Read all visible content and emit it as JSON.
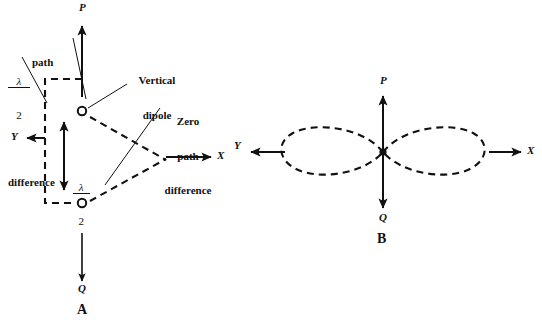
{
  "figure": {
    "ink_color": "#111111",
    "background_color": "#ffffff"
  },
  "diagram_a": {
    "panel_label": "A",
    "axes": {
      "up_label": "P",
      "down_label": "Q",
      "right_label": "X",
      "left_label": "Y"
    },
    "annotations": {
      "half_lambda_path_difference": {
        "fraction_numerator": "λ",
        "fraction_denominator": "2",
        "text_line_1": "path",
        "text_line_2": "difference"
      },
      "vertical_dipole": {
        "line_1": "Vertical",
        "line_2": "dipole"
      },
      "zero_path_difference": {
        "line_1": "Zero",
        "line_2": "path",
        "line_3": "difference"
      },
      "spacing": {
        "fraction_numerator": "λ",
        "fraction_denominator": "2"
      }
    },
    "elements": {
      "upper_dipole": "dipole-circle-upper",
      "lower_dipole": "dipole-circle-lower",
      "spacing_arrow": "double-headed-spacing-arrow",
      "construction_path": "dashed-path-difference-outline"
    }
  },
  "diagram_b": {
    "panel_label": "B",
    "axes": {
      "up_label": "P",
      "down_label": "Q",
      "right_label": "X",
      "left_label": "Y"
    },
    "elements": {
      "pattern": "figure-eight-radiation-lobes",
      "left_lobe": "radiation-lobe-left",
      "right_lobe": "radiation-lobe-right",
      "center_marker": "dipole-center-marker"
    }
  }
}
